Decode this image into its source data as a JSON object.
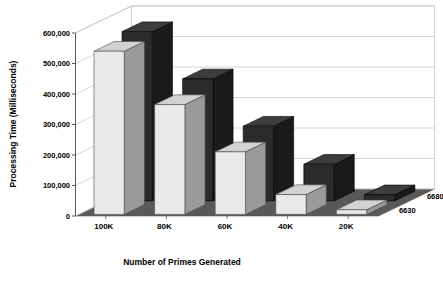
{
  "chart_data": {
    "type": "bar",
    "title": "",
    "subtitle": "",
    "xlabel": "Number of Primes Generated",
    "ylabel": "Processing Time (Milliseconds)",
    "categories": [
      "100K",
      "80K",
      "60K",
      "40K",
      "20K"
    ],
    "series": [
      {
        "name": "6680",
        "values": [
          555000,
          400000,
          245000,
          120000,
          20000
        ]
      },
      {
        "name": "6630",
        "values": [
          535000,
          360000,
          205000,
          65000,
          15000
        ]
      }
    ],
    "ytick_labels": [
      "600,000",
      "500,000",
      "400,000",
      "300,000",
      "200,000",
      "100,000",
      "0"
    ],
    "ytick_values": [
      600000,
      500000,
      400000,
      300000,
      200000,
      100000,
      0
    ],
    "ylim": [
      0,
      600000
    ],
    "grid": true,
    "grid_axis": "y",
    "legend_position": "depth-axis-right",
    "projection": "3d",
    "colors": {
      "series_6680_front": "#2b2b2b",
      "series_6680_side": "#1a1a1a",
      "series_6680_top": "#3d3d3d",
      "series_6630_front": "#e9e9e9",
      "series_6630_side": "#9a9a9a",
      "series_6630_top": "#d2d2d2",
      "floor": "#595959",
      "wall": "#ffffff",
      "gridline": "#b8b8b8",
      "axis": "#555555",
      "text": "#000000"
    }
  }
}
